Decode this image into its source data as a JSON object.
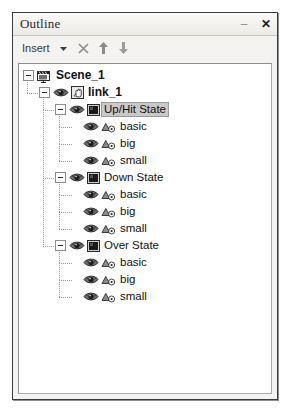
{
  "window": {
    "title": "Outline",
    "minimize_label": "–",
    "close_label": "✕",
    "minimize_icon": "minimize-icon",
    "close_icon": "close-icon"
  },
  "toolbar": {
    "insert_label": "Insert",
    "dropdown_icon": "chevron-down-icon",
    "delete_icon": "x-delete-icon",
    "move_up_icon": "arrow-up-icon",
    "move_down_icon": "arrow-down-icon"
  },
  "tree": {
    "nodes": [
      {
        "label": "Scene_1",
        "depth": 0,
        "icon": "scene-clapper-icon",
        "expander": "expanded",
        "bold": true,
        "selected": false,
        "eye": false
      },
      {
        "label": "link_1",
        "depth": 1,
        "icon": "hand-link-icon",
        "expander": "expanded",
        "bold": true,
        "selected": false,
        "eye": true
      },
      {
        "label": "Up/Hit State",
        "depth": 2,
        "icon": "state-square-icon",
        "expander": "expanded",
        "bold": false,
        "selected": true,
        "eye": true
      },
      {
        "label": "basic",
        "depth": 3,
        "icon": "shape-object-icon",
        "expander": "none",
        "bold": false,
        "selected": false,
        "eye": true
      },
      {
        "label": "big",
        "depth": 3,
        "icon": "shape-object-icon",
        "expander": "none",
        "bold": false,
        "selected": false,
        "eye": true
      },
      {
        "label": "small",
        "depth": 3,
        "icon": "shape-object-icon",
        "expander": "none",
        "bold": false,
        "selected": false,
        "eye": true
      },
      {
        "label": "Down State",
        "depth": 2,
        "icon": "state-square-icon",
        "expander": "expanded",
        "bold": false,
        "selected": false,
        "eye": true
      },
      {
        "label": "basic",
        "depth": 3,
        "icon": "shape-object-icon",
        "expander": "none",
        "bold": false,
        "selected": false,
        "eye": true
      },
      {
        "label": "big",
        "depth": 3,
        "icon": "shape-object-icon",
        "expander": "none",
        "bold": false,
        "selected": false,
        "eye": true
      },
      {
        "label": "small",
        "depth": 3,
        "icon": "shape-object-icon",
        "expander": "none",
        "bold": false,
        "selected": false,
        "eye": true
      },
      {
        "label": "Over State",
        "depth": 2,
        "icon": "state-square-icon",
        "expander": "expanded",
        "bold": false,
        "selected": false,
        "eye": true
      },
      {
        "label": "basic",
        "depth": 3,
        "icon": "shape-object-icon",
        "expander": "none",
        "bold": false,
        "selected": false,
        "eye": true
      },
      {
        "label": "big",
        "depth": 3,
        "icon": "shape-object-icon",
        "expander": "none",
        "bold": false,
        "selected": false,
        "eye": true
      },
      {
        "label": "small",
        "depth": 3,
        "icon": "shape-object-icon",
        "expander": "none",
        "bold": false,
        "selected": false,
        "eye": true
      }
    ]
  },
  "colors": {
    "panel_bg": "#f4f3f1",
    "tree_bg": "#ffffff",
    "selection": "#c9c9c9",
    "border": "#3c3c3c",
    "text": "#111111"
  }
}
